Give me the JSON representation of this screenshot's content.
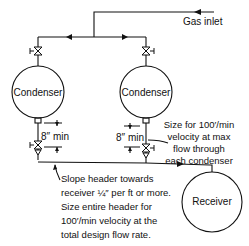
{
  "diagram": {
    "gas_inlet_label": "Gas inlet",
    "condenser_left_label": "Condenser",
    "condenser_right_label": "Condenser",
    "receiver_label": "Receiver",
    "min_left_label": "8″ min",
    "min_right_label": "8″ min",
    "note_right": [
      "Size for 100′/min",
      "velocity at max",
      "flow through",
      "each condenser"
    ],
    "note_bottom": [
      "Slope header towards",
      "receiver ¼″ per ft or more.",
      "Size entire header for",
      "100′/min velocity at the",
      "total design flow rate."
    ]
  },
  "colors": {
    "line": "#111111",
    "background": "#ffffff"
  }
}
